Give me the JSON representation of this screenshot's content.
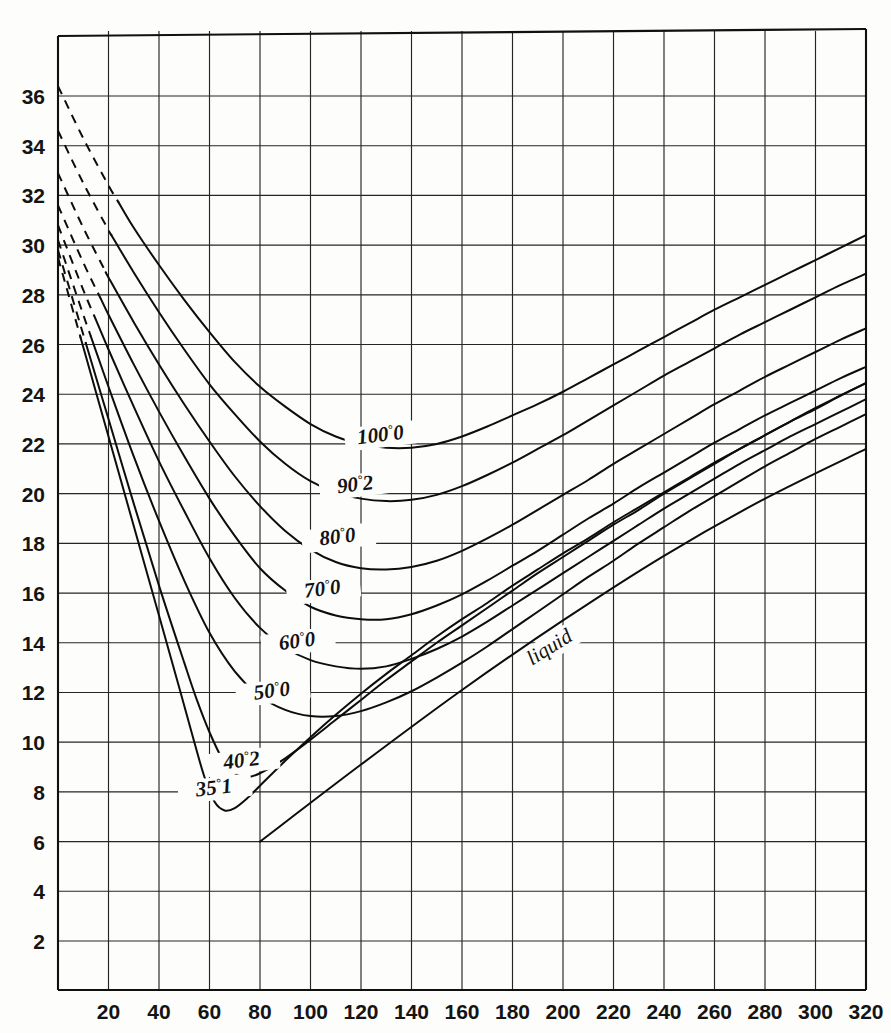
{
  "figure": {
    "name": "isotherm-chart",
    "background_color": "#fdfdfc",
    "ink_color": "#111111"
  },
  "chart_data": {
    "type": "line",
    "title": "",
    "subtitle": "",
    "xlabel": "",
    "ylabel": "",
    "xlim": [
      0,
      320
    ],
    "ylim": [
      0,
      38
    ],
    "grid": true,
    "grid_x_step": 20,
    "grid_y_step": 2,
    "legend_position": "inline-labels",
    "xticks": [
      20,
      40,
      60,
      80,
      100,
      120,
      140,
      160,
      180,
      200,
      220,
      240,
      260,
      280,
      300,
      320
    ],
    "yticks": [
      2,
      4,
      6,
      8,
      10,
      12,
      14,
      16,
      18,
      20,
      22,
      24,
      26,
      28,
      30,
      32,
      34,
      36
    ],
    "annotations": [
      {
        "text": "liquid",
        "x": 196,
        "y": 13.6,
        "rotation": -32,
        "style": "italic"
      }
    ],
    "series": [
      {
        "name": "100°0",
        "label": "100°0",
        "label_main": "100",
        "label_sup": "°",
        "label_tail": "0",
        "label_x": 128,
        "label_y": 22.1,
        "dashed_until_x": 24,
        "points": [
          [
            0,
            36.4
          ],
          [
            10,
            34.3
          ],
          [
            20,
            32.4
          ],
          [
            30,
            30.7
          ],
          [
            40,
            29.2
          ],
          [
            50,
            27.8
          ],
          [
            60,
            26.5
          ],
          [
            70,
            25.3
          ],
          [
            80,
            24.3
          ],
          [
            90,
            23.5
          ],
          [
            100,
            22.8
          ],
          [
            110,
            22.3
          ],
          [
            120,
            22.0
          ],
          [
            130,
            21.85
          ],
          [
            140,
            21.85
          ],
          [
            150,
            22.0
          ],
          [
            160,
            22.3
          ],
          [
            170,
            22.7
          ],
          [
            180,
            23.15
          ],
          [
            190,
            23.6
          ],
          [
            200,
            24.1
          ],
          [
            210,
            24.65
          ],
          [
            220,
            25.2
          ],
          [
            230,
            25.75
          ],
          [
            240,
            26.3
          ],
          [
            250,
            26.85
          ],
          [
            260,
            27.4
          ],
          [
            270,
            27.9
          ],
          [
            280,
            28.4
          ],
          [
            290,
            28.9
          ],
          [
            300,
            29.4
          ],
          [
            310,
            29.9
          ],
          [
            320,
            30.4
          ]
        ]
      },
      {
        "name": "90°2",
        "label": "90°2",
        "label_main": "90",
        "label_sup": "°",
        "label_tail": "2",
        "label_x": 118,
        "label_y": 20.1,
        "dashed_until_x": 21,
        "points": [
          [
            0,
            34.6
          ],
          [
            10,
            32.5
          ],
          [
            20,
            30.6
          ],
          [
            30,
            28.9
          ],
          [
            40,
            27.3
          ],
          [
            50,
            25.8
          ],
          [
            60,
            24.4
          ],
          [
            70,
            23.2
          ],
          [
            80,
            22.1
          ],
          [
            90,
            21.2
          ],
          [
            100,
            20.5
          ],
          [
            110,
            20.05
          ],
          [
            120,
            19.8
          ],
          [
            130,
            19.7
          ],
          [
            140,
            19.75
          ],
          [
            150,
            19.95
          ],
          [
            160,
            20.3
          ],
          [
            170,
            20.75
          ],
          [
            180,
            21.25
          ],
          [
            190,
            21.8
          ],
          [
            200,
            22.35
          ],
          [
            210,
            22.95
          ],
          [
            220,
            23.55
          ],
          [
            230,
            24.15
          ],
          [
            240,
            24.75
          ],
          [
            250,
            25.3
          ],
          [
            260,
            25.85
          ],
          [
            270,
            26.4
          ],
          [
            280,
            26.9
          ],
          [
            290,
            27.4
          ],
          [
            300,
            27.9
          ],
          [
            310,
            28.4
          ],
          [
            320,
            28.85
          ]
        ]
      },
      {
        "name": "80°0",
        "label": "80°0",
        "label_main": "80",
        "label_sup": "°",
        "label_tail": "0",
        "label_x": 111,
        "label_y": 18.0,
        "dashed_until_x": 19,
        "points": [
          [
            0,
            32.9
          ],
          [
            10,
            30.7
          ],
          [
            20,
            28.7
          ],
          [
            30,
            26.9
          ],
          [
            40,
            25.2
          ],
          [
            50,
            23.6
          ],
          [
            60,
            22.1
          ],
          [
            70,
            20.7
          ],
          [
            80,
            19.5
          ],
          [
            90,
            18.5
          ],
          [
            100,
            17.75
          ],
          [
            110,
            17.25
          ],
          [
            120,
            17.0
          ],
          [
            130,
            16.95
          ],
          [
            140,
            17.05
          ],
          [
            150,
            17.3
          ],
          [
            160,
            17.7
          ],
          [
            170,
            18.2
          ],
          [
            180,
            18.75
          ],
          [
            190,
            19.35
          ],
          [
            200,
            19.95
          ],
          [
            210,
            20.55
          ],
          [
            220,
            21.2
          ],
          [
            230,
            21.8
          ],
          [
            240,
            22.4
          ],
          [
            250,
            23.0
          ],
          [
            260,
            23.6
          ],
          [
            270,
            24.15
          ],
          [
            280,
            24.7
          ],
          [
            290,
            25.2
          ],
          [
            300,
            25.7
          ],
          [
            310,
            26.2
          ],
          [
            320,
            26.65
          ]
        ]
      },
      {
        "name": "70°0",
        "label": "70°0",
        "label_main": "70",
        "label_sup": "°",
        "label_tail": "0",
        "label_x": 105,
        "label_y": 15.9,
        "dashed_until_x": 17,
        "points": [
          [
            0,
            31.6
          ],
          [
            10,
            29.3
          ],
          [
            20,
            27.2
          ],
          [
            30,
            25.2
          ],
          [
            40,
            23.3
          ],
          [
            50,
            21.5
          ],
          [
            60,
            19.8
          ],
          [
            70,
            18.3
          ],
          [
            80,
            17.0
          ],
          [
            90,
            16.1
          ],
          [
            100,
            15.45
          ],
          [
            110,
            15.1
          ],
          [
            120,
            14.95
          ],
          [
            130,
            14.95
          ],
          [
            140,
            15.15
          ],
          [
            150,
            15.5
          ],
          [
            160,
            15.95
          ],
          [
            170,
            16.5
          ],
          [
            180,
            17.1
          ],
          [
            190,
            17.7
          ],
          [
            200,
            18.35
          ],
          [
            210,
            19.0
          ],
          [
            220,
            19.6
          ],
          [
            230,
            20.25
          ],
          [
            240,
            20.85
          ],
          [
            250,
            21.45
          ],
          [
            260,
            22.05
          ],
          [
            270,
            22.6
          ],
          [
            280,
            23.15
          ],
          [
            290,
            23.65
          ],
          [
            300,
            24.15
          ],
          [
            310,
            24.65
          ],
          [
            320,
            25.1
          ]
        ]
      },
      {
        "name": "60°0",
        "label": "60°0",
        "label_main": "60",
        "label_sup": "°",
        "label_tail": "0",
        "label_x": 95,
        "label_y": 13.8,
        "dashed_until_x": 15,
        "points": [
          [
            0,
            30.8
          ],
          [
            10,
            28.2
          ],
          [
            20,
            25.8
          ],
          [
            30,
            23.5
          ],
          [
            40,
            21.3
          ],
          [
            50,
            19.3
          ],
          [
            60,
            17.4
          ],
          [
            70,
            15.8
          ],
          [
            80,
            14.6
          ],
          [
            90,
            13.8
          ],
          [
            100,
            13.3
          ],
          [
            110,
            13.05
          ],
          [
            120,
            12.95
          ],
          [
            130,
            13.05
          ],
          [
            140,
            13.35
          ],
          [
            150,
            13.75
          ],
          [
            160,
            14.25
          ],
          [
            170,
            14.85
          ],
          [
            180,
            15.5
          ],
          [
            190,
            16.15
          ],
          [
            200,
            16.8
          ],
          [
            210,
            17.45
          ],
          [
            220,
            18.1
          ],
          [
            230,
            18.75
          ],
          [
            240,
            19.4
          ],
          [
            250,
            20.0
          ],
          [
            260,
            20.6
          ],
          [
            270,
            21.2
          ],
          [
            280,
            21.75
          ],
          [
            290,
            22.3
          ],
          [
            300,
            22.8
          ],
          [
            310,
            23.3
          ],
          [
            320,
            23.8
          ]
        ]
      },
      {
        "name": "50°0",
        "label": "50°0",
        "label_main": "50",
        "label_sup": "°",
        "label_tail": "0",
        "label_x": 85,
        "label_y": 11.8,
        "dashed_until_x": 13,
        "points": [
          [
            0,
            30.2
          ],
          [
            10,
            27.2
          ],
          [
            20,
            24.3
          ],
          [
            30,
            21.5
          ],
          [
            40,
            18.9
          ],
          [
            50,
            16.5
          ],
          [
            60,
            14.4
          ],
          [
            70,
            12.85
          ],
          [
            80,
            11.85
          ],
          [
            90,
            11.3
          ],
          [
            100,
            11.05
          ],
          [
            110,
            11.05
          ],
          [
            120,
            11.25
          ],
          [
            130,
            11.6
          ],
          [
            140,
            12.05
          ],
          [
            150,
            12.6
          ],
          [
            160,
            13.2
          ],
          [
            170,
            13.85
          ],
          [
            180,
            14.55
          ],
          [
            190,
            15.25
          ],
          [
            200,
            15.95
          ],
          [
            210,
            16.65
          ],
          [
            220,
            17.3
          ],
          [
            230,
            18.0
          ],
          [
            240,
            18.65
          ],
          [
            250,
            19.3
          ],
          [
            260,
            19.9
          ],
          [
            270,
            20.5
          ],
          [
            280,
            21.1
          ],
          [
            290,
            21.65
          ],
          [
            300,
            22.2
          ],
          [
            310,
            22.7
          ],
          [
            320,
            23.2
          ]
        ]
      },
      {
        "name": "40°2",
        "label": "40°2",
        "label_main": "40",
        "label_sup": "°",
        "label_tail": "2",
        "label_x": 73,
        "label_y": 9.0,
        "dashed_until_x": 11,
        "points": [
          [
            0,
            29.8
          ],
          [
            10,
            26.4
          ],
          [
            20,
            23.0
          ],
          [
            30,
            19.6
          ],
          [
            40,
            16.3
          ],
          [
            50,
            13.2
          ],
          [
            55,
            11.7
          ],
          [
            60,
            10.4
          ],
          [
            65,
            9.35
          ],
          [
            70,
            8.75
          ],
          [
            75,
            8.6
          ],
          [
            80,
            8.75
          ],
          [
            90,
            9.35
          ],
          [
            100,
            10.1
          ],
          [
            110,
            10.9
          ],
          [
            120,
            11.7
          ],
          [
            130,
            12.5
          ],
          [
            140,
            13.25
          ],
          [
            150,
            14.0
          ],
          [
            160,
            14.7
          ],
          [
            170,
            15.4
          ],
          [
            180,
            16.1
          ],
          [
            190,
            16.8
          ],
          [
            200,
            17.45
          ],
          [
            210,
            18.1
          ],
          [
            220,
            18.75
          ],
          [
            230,
            19.35
          ],
          [
            240,
            20.0
          ],
          [
            250,
            20.6
          ],
          [
            260,
            21.2
          ],
          [
            270,
            21.8
          ],
          [
            280,
            22.35
          ],
          [
            290,
            22.9
          ],
          [
            300,
            23.4
          ],
          [
            310,
            23.95
          ],
          [
            320,
            24.45
          ]
        ]
      },
      {
        "name": "35°1",
        "label": "35°1",
        "label_main": "35",
        "label_sup": "°",
        "label_tail": "1",
        "label_x": 62,
        "label_y": 7.9,
        "dashed_until_x": 9,
        "points": [
          [
            0,
            29.5
          ],
          [
            10,
            25.9
          ],
          [
            20,
            22.3
          ],
          [
            30,
            18.7
          ],
          [
            40,
            15.1
          ],
          [
            48,
            12.2
          ],
          [
            54,
            10.0
          ],
          [
            58,
            8.6
          ],
          [
            62,
            7.6
          ],
          [
            66,
            7.25
          ],
          [
            70,
            7.35
          ],
          [
            75,
            7.75
          ],
          [
            80,
            8.25
          ],
          [
            90,
            9.25
          ],
          [
            100,
            10.2
          ],
          [
            110,
            11.1
          ],
          [
            120,
            11.95
          ],
          [
            130,
            12.75
          ],
          [
            140,
            13.5
          ],
          [
            150,
            14.25
          ],
          [
            160,
            14.95
          ],
          [
            170,
            15.6
          ],
          [
            180,
            16.3
          ],
          [
            190,
            16.95
          ],
          [
            200,
            17.6
          ],
          [
            210,
            18.2
          ],
          [
            220,
            18.85
          ],
          [
            230,
            19.45
          ],
          [
            240,
            20.05
          ],
          [
            250,
            20.65
          ],
          [
            260,
            21.25
          ],
          [
            270,
            21.8
          ],
          [
            280,
            22.35
          ],
          [
            290,
            22.9
          ],
          [
            300,
            23.45
          ],
          [
            310,
            23.95
          ],
          [
            320,
            24.45
          ]
        ]
      },
      {
        "name": "liquid",
        "label": "liquid",
        "label_main": "liquid",
        "label_sup": "",
        "label_tail": "",
        "label_x": 196,
        "label_y": 13.6,
        "dashed_until_x": -1,
        "points": [
          [
            80,
            6.0
          ],
          [
            120,
            9.1
          ],
          [
            160,
            12.1
          ],
          [
            200,
            14.9
          ],
          [
            240,
            17.5
          ],
          [
            280,
            19.8
          ],
          [
            320,
            21.8
          ]
        ]
      }
    ]
  }
}
